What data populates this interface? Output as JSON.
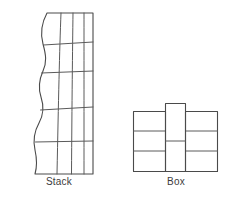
{
  "figure": {
    "background_color": "#ffffff",
    "line_color": "#5a5a5a",
    "label_color": "#3c3c3c",
    "panels": [
      {
        "name": "stack",
        "label": "Stack",
        "shape": "grid",
        "columns": 4,
        "rows": 5,
        "left_edge_style": "wavy",
        "right_edge_style": "straight",
        "bounds": {
          "x": 25,
          "y": 12,
          "width": 70,
          "height": 163
        }
      },
      {
        "name": "box",
        "label": "Box",
        "shape": "interlocking-columns",
        "columns": 3,
        "column_cells": [
          3,
          2,
          3
        ],
        "center_column_protrudes": true,
        "bounds": {
          "x": 133,
          "y": 103,
          "width": 85,
          "height": 69
        }
      }
    ]
  },
  "labels": {
    "stack": "Stack",
    "box": "Box"
  }
}
